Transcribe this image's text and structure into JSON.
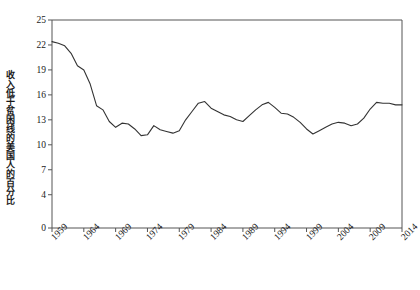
{
  "chart_data": {
    "type": "line",
    "title": "",
    "subtitle": "",
    "xlabel": "",
    "ylabel": "收入低于贫困线的美国人的百分比",
    "xlim": [
      1959,
      2014
    ],
    "ylim": [
      0,
      25
    ],
    "yticks": [
      0,
      4,
      7,
      10,
      13,
      16,
      19,
      22,
      25
    ],
    "xticks": [
      1959,
      1964,
      1969,
      1974,
      1979,
      1984,
      1989,
      1994,
      1999,
      2004,
      2009,
      2014
    ],
    "grid": false,
    "legend": null,
    "line_color": "#333333",
    "x": [
      1959,
      1960,
      1961,
      1962,
      1963,
      1964,
      1965,
      1966,
      1967,
      1968,
      1969,
      1970,
      1971,
      1972,
      1973,
      1974,
      1975,
      1976,
      1977,
      1978,
      1979,
      1980,
      1981,
      1982,
      1983,
      1984,
      1985,
      1986,
      1987,
      1988,
      1989,
      1990,
      1991,
      1992,
      1993,
      1994,
      1995,
      1996,
      1997,
      1998,
      1999,
      2000,
      2001,
      2002,
      2003,
      2004,
      2005,
      2006,
      2007,
      2008,
      2009,
      2010,
      2011,
      2012,
      2013,
      2014
    ],
    "values": [
      22.4,
      22.2,
      21.9,
      21.0,
      19.5,
      19.0,
      17.3,
      14.7,
      14.2,
      12.8,
      12.1,
      12.6,
      12.5,
      11.9,
      11.1,
      11.2,
      12.3,
      11.8,
      11.6,
      11.4,
      11.7,
      13.0,
      14.0,
      15.0,
      15.2,
      14.4,
      14.0,
      13.6,
      13.4,
      13.0,
      12.8,
      13.5,
      14.2,
      14.8,
      15.1,
      14.5,
      13.8,
      13.7,
      13.3,
      12.7,
      11.9,
      11.3,
      11.7,
      12.1,
      12.5,
      12.7,
      12.6,
      12.3,
      12.5,
      13.2,
      14.3,
      15.1,
      15.0,
      15.0,
      14.8,
      14.8
    ],
    "axis_color": "#555555"
  },
  "tick_labels": {
    "y": [
      "25",
      "22",
      "19",
      "16",
      "13",
      "10",
      "7",
      "4",
      "0"
    ],
    "x": [
      "1959",
      "1964",
      "1969",
      "1974",
      "1979",
      "1984",
      "1989",
      "1994",
      "1999",
      "2004",
      "2009",
      "2014"
    ]
  }
}
